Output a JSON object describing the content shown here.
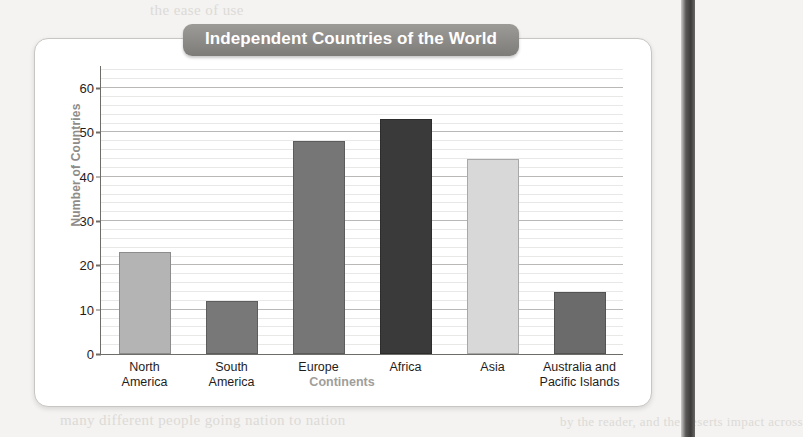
{
  "page": {
    "bleed_top": "the ease of use",
    "bleed_bottom": "many different people going nation to nation",
    "bleed_right": "by the reader, and the deserts impact across"
  },
  "colors": {
    "banner_bg": "#8c8a87",
    "banner_text": "#ffffff",
    "axis": "#6f6d6a",
    "gridline_major": "#b9b8b6",
    "gridline_minor": "#e8e8e6",
    "axis_title": "#8e8c89",
    "card_bg": "#ffffff",
    "page_bg": "#f4f3f1"
  },
  "chart_data": {
    "type": "bar",
    "title": "Independent Countries of the World",
    "xlabel": "Continents",
    "ylabel": "Number of Countries",
    "categories": [
      "North America",
      "South America",
      "Europe",
      "Africa",
      "Asia",
      "Australia and Pacific Islands"
    ],
    "category_lines": [
      [
        "North",
        "America"
      ],
      [
        "South",
        "America"
      ],
      [
        "Europe"
      ],
      [
        "Africa"
      ],
      [
        "Asia"
      ],
      [
        "Australia and",
        "Pacific Islands"
      ]
    ],
    "values": [
      23,
      12,
      48,
      53,
      44,
      14
    ],
    "bar_colors": [
      "#b4b4b4",
      "#787878",
      "#767676",
      "#3a3a3a",
      "#d8d8d8",
      "#6b6b6b"
    ],
    "ylim": [
      0,
      65
    ],
    "yticks": [
      0,
      10,
      20,
      30,
      40,
      50,
      60
    ],
    "ytick_labels": [
      "0",
      "10",
      "20",
      "30",
      "40",
      "50",
      "60"
    ],
    "minor_tick_step": 2,
    "grid": true,
    "legend": "none"
  }
}
